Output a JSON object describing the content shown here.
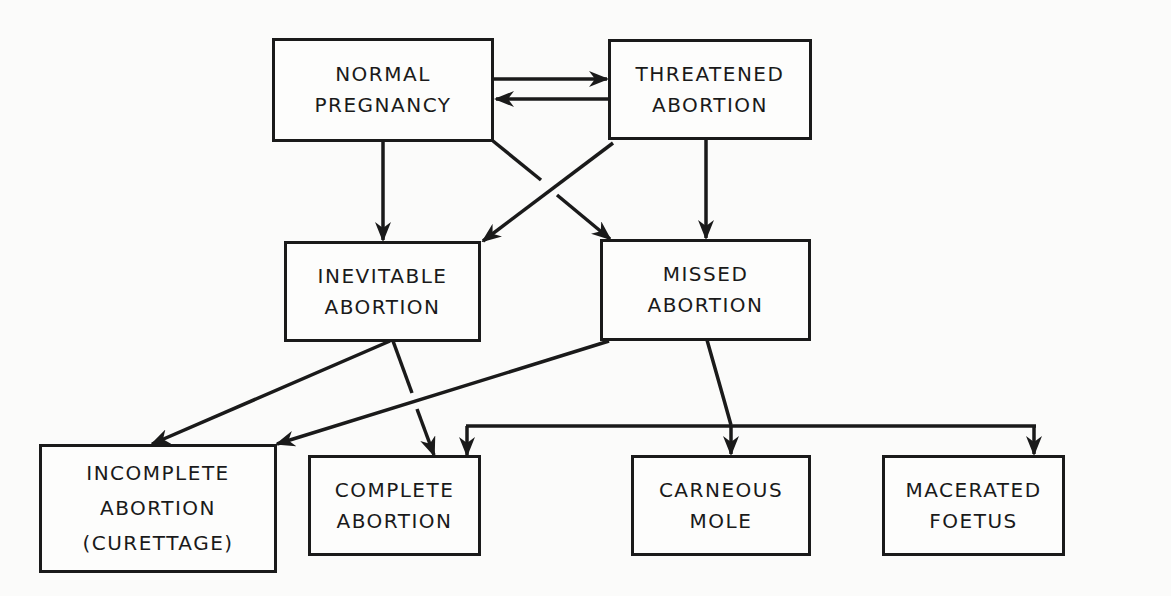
{
  "diagram": {
    "type": "flowchart",
    "colors": {
      "stroke": "#1a1a1a",
      "background": "#fbfbfa"
    },
    "nodes": {
      "normal": {
        "lines": [
          "NORMAL",
          "PREGNANCY"
        ]
      },
      "threatened": {
        "lines": [
          "THREATENED",
          "ABORTION"
        ]
      },
      "inevitable": {
        "lines": [
          "INEVITABLE",
          "ABORTION"
        ]
      },
      "missed": {
        "lines": [
          "MISSED",
          "ABORTION"
        ]
      },
      "incomplete": {
        "lines": [
          "INCOMPLETE",
          "ABORTION",
          "(CURETTAGE)"
        ]
      },
      "complete": {
        "lines": [
          "COMPLETE",
          "ABORTION"
        ]
      },
      "carneous": {
        "lines": [
          "CARNEOUS",
          "MOLE"
        ]
      },
      "macerated": {
        "lines": [
          "MACERATED",
          "FOETUS"
        ]
      }
    },
    "edges": [
      {
        "from": "normal",
        "to": "threatened"
      },
      {
        "from": "threatened",
        "to": "normal"
      },
      {
        "from": "normal",
        "to": "inevitable"
      },
      {
        "from": "normal",
        "to": "missed"
      },
      {
        "from": "threatened",
        "to": "inevitable"
      },
      {
        "from": "threatened",
        "to": "missed"
      },
      {
        "from": "inevitable",
        "to": "incomplete"
      },
      {
        "from": "inevitable",
        "to": "complete"
      },
      {
        "from": "missed",
        "to": "incomplete"
      },
      {
        "from": "missed",
        "to": "complete"
      },
      {
        "from": "missed",
        "to": "carneous"
      },
      {
        "from": "missed",
        "to": "macerated"
      }
    ]
  }
}
